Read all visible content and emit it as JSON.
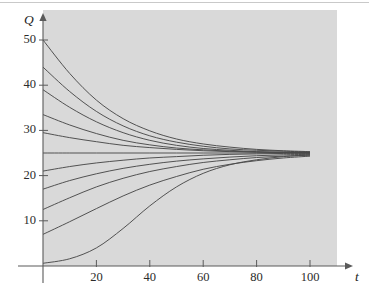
{
  "figure": {
    "background": "#ffffff",
    "panel_color": "#d9d9d9",
    "curve_color": "#4a4a4a",
    "axis_color": "#5a5a5a",
    "y_axis_name": "Q",
    "x_axis_name": "t"
  },
  "chart_data": {
    "type": "line",
    "title": "",
    "xlabel": "t",
    "ylabel": "Q",
    "xlim": [
      0,
      112
    ],
    "ylim": [
      0,
      53
    ],
    "grid": false,
    "legend": "none",
    "xticks": [
      20,
      40,
      60,
      80,
      100
    ],
    "yticks": [
      10,
      20,
      30,
      40,
      50
    ],
    "xtick_labels": [
      "20",
      "40",
      "60",
      "80",
      "100"
    ],
    "ytick_labels": [
      "10",
      "20",
      "30",
      "40",
      "50"
    ],
    "annotation": "Family of logistic solution curves approaching the equilibrium Q = 25",
    "equilibrium": 25,
    "x_start": 0,
    "x_end": 100,
    "series": [
      {
        "name": "Q0 = 50",
        "y0": 50,
        "values": [
          50,
          42.6,
          36.7,
          32.6,
          29.9,
          28.1,
          27.0,
          26.3,
          25.8,
          25.5,
          25.3
        ]
      },
      {
        "name": "Q0 = 44",
        "y0": 44,
        "values": [
          44,
          38.6,
          34.2,
          31.0,
          28.8,
          27.4,
          26.5,
          25.9,
          25.6,
          25.4,
          25.2
        ]
      },
      {
        "name": "Q0 = 39",
        "y0": 39,
        "values": [
          39,
          35.1,
          31.9,
          29.5,
          27.8,
          26.7,
          26.0,
          25.6,
          25.3,
          25.2,
          25.1
        ]
      },
      {
        "name": "Q0 = 33.5",
        "y0": 33.5,
        "values": [
          33.5,
          31.2,
          29.3,
          27.8,
          26.8,
          26.1,
          25.7,
          25.4,
          25.2,
          25.1,
          25.1
        ]
      },
      {
        "name": "Q0 = 29.5",
        "y0": 29.5,
        "values": [
          29.5,
          28.4,
          27.5,
          26.7,
          26.2,
          25.8,
          25.5,
          25.3,
          25.2,
          25.1,
          25.0
        ]
      },
      {
        "name": "Q0 = 25",
        "y0": 25,
        "values": [
          25,
          25,
          25,
          25,
          25,
          25,
          25,
          25,
          25,
          25,
          25
        ]
      },
      {
        "name": "Q0 = 21",
        "y0": 21,
        "values": [
          21,
          22.0,
          22.8,
          23.4,
          23.9,
          24.2,
          24.5,
          24.7,
          24.8,
          24.9,
          24.9
        ]
      },
      {
        "name": "Q0 = 17",
        "y0": 17,
        "values": [
          17,
          18.9,
          20.4,
          21.6,
          22.5,
          23.2,
          23.7,
          24.1,
          24.4,
          24.6,
          24.7
        ]
      },
      {
        "name": "Q0 = 12.5",
        "y0": 12.5,
        "values": [
          12.5,
          15.1,
          17.5,
          19.4,
          20.9,
          22.0,
          22.9,
          23.5,
          24.0,
          24.3,
          24.5
        ]
      },
      {
        "name": "Q0 = 7",
        "y0": 7,
        "values": [
          7,
          9.8,
          12.7,
          15.5,
          17.9,
          19.8,
          21.4,
          22.5,
          23.3,
          23.9,
          24.3
        ]
      },
      {
        "name": "Q0 = 0.6",
        "y0": 0.6,
        "values": [
          0.6,
          1.6,
          4.0,
          8.3,
          13.3,
          17.5,
          20.5,
          22.4,
          23.5,
          24.2,
          24.6
        ]
      }
    ]
  }
}
